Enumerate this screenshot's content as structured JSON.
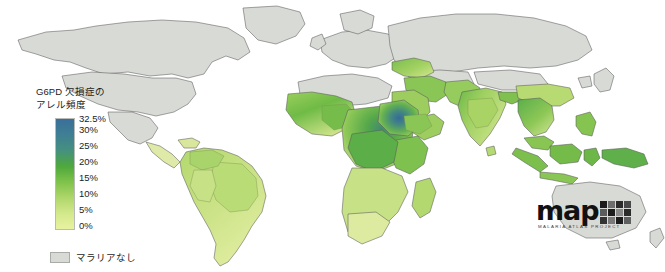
{
  "figure": {
    "background_color": "#ffffff",
    "width": 665,
    "height": 272
  },
  "legend": {
    "title": "G6PD 欠損症の\nアレル頻度",
    "title_line1": "G6PD 欠損症の",
    "title_line2": "アレル頻度",
    "ticks": [
      "32.5%",
      "30%",
      "25%",
      "20%",
      "15%",
      "10%",
      "5%",
      "0%"
    ],
    "no_data": {
      "label": "マラリアなし",
      "swatch_color": "#d8dad6"
    },
    "colorbar": {
      "orientation": "vertical",
      "min_label": "0%",
      "max_label": "32.5%",
      "stops": [
        "#3a6f9a",
        "#3f7f93",
        "#45907f",
        "#4ea83c",
        "#7ec24a",
        "#aed66a",
        "#d3e88c",
        "#e8f2a0"
      ]
    }
  },
  "logo": {
    "word": "map",
    "subtitle": "MALARIA ATLAS PROJECT",
    "grid_colors": [
      "#1c1c1c",
      "#6e6e6e",
      "#2b2b2b",
      "#4a4a4a",
      "#5c5c5c",
      "#1c1c1c",
      "#8a8a8a",
      "#2b2b2b",
      "#333333",
      "#7a7a7a",
      "#1c1c1c",
      "#606060"
    ]
  },
  "chart_data": {
    "type": "heatmap",
    "subtitle": "",
    "xlabel": "",
    "ylabel": "",
    "value_unit": "%",
    "value_range": [
      0,
      32.5
    ],
    "colorbar_ticks": [
      0,
      5,
      10,
      15,
      20,
      25,
      30,
      32.5
    ],
    "legend_position": "left",
    "grid": false,
    "no_data_label": "マラリアなし",
    "no_data_color": "#d8dad6",
    "colormap_stops": [
      {
        "value": 0,
        "color": "#e8f2a0"
      },
      {
        "value": 5,
        "color": "#d3e88c"
      },
      {
        "value": 10,
        "color": "#aed66a"
      },
      {
        "value": 15,
        "color": "#7ec24a"
      },
      {
        "value": 20,
        "color": "#4ea83c"
      },
      {
        "value": 25,
        "color": "#45907f"
      },
      {
        "value": 30,
        "color": "#3f7f93"
      },
      {
        "value": 32.5,
        "color": "#3a6f9a"
      }
    ],
    "regions": [
      {
        "name": "North America",
        "value": null,
        "status": "no-malaria"
      },
      {
        "name": "Europe",
        "value": null,
        "status": "no-malaria"
      },
      {
        "name": "Russia",
        "value": null,
        "status": "no-malaria"
      },
      {
        "name": "Australia",
        "value": null,
        "status": "no-malaria"
      },
      {
        "name": "North Africa",
        "value": null,
        "status": "no-malaria"
      },
      {
        "name": "Sudan / Central Africa hotspot",
        "value": 30,
        "status": "mapped"
      },
      {
        "name": "West Africa",
        "value": 17,
        "status": "mapped"
      },
      {
        "name": "Central Africa",
        "value": 20,
        "status": "mapped"
      },
      {
        "name": "East Africa",
        "value": 14,
        "status": "mapped"
      },
      {
        "name": "Southern Africa",
        "value": 5,
        "status": "mapped"
      },
      {
        "name": "Arabian Peninsula",
        "value": 13,
        "status": "mapped"
      },
      {
        "name": "Middle East",
        "value": 12,
        "status": "mapped"
      },
      {
        "name": "India",
        "value": 9,
        "status": "mapped"
      },
      {
        "name": "Southeast Asia",
        "value": 11,
        "status": "mapped"
      },
      {
        "name": "Indonesia / Papua New Guinea",
        "value": 13,
        "status": "mapped"
      },
      {
        "name": "South America (Amazon)",
        "value": 5,
        "status": "mapped"
      },
      {
        "name": "Northern South America",
        "value": 7,
        "status": "mapped"
      },
      {
        "name": "Southern South America",
        "value": 2,
        "status": "mapped"
      },
      {
        "name": "Central America",
        "value": 3,
        "status": "mapped"
      }
    ]
  }
}
